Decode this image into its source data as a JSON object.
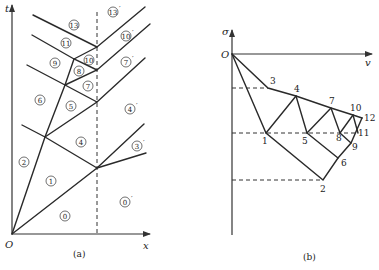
{
  "panel_a": {
    "caption": "(a)",
    "y_axis_label": "t",
    "x_axis_label": "x",
    "origin_label": "O",
    "regions": [
      {
        "id": "r13",
        "label": "13",
        "prime": false,
        "x": 74,
        "y": 25
      },
      {
        "id": "r13p",
        "label": "13",
        "prime": true,
        "x": 113,
        "y": 12
      },
      {
        "id": "r11",
        "label": "11",
        "prime": false,
        "x": 66,
        "y": 43
      },
      {
        "id": "r10p",
        "label": "10",
        "prime": true,
        "x": 126,
        "y": 36
      },
      {
        "id": "r9",
        "label": "9",
        "prime": false,
        "x": 55,
        "y": 63
      },
      {
        "id": "r10",
        "label": "10",
        "prime": false,
        "x": 89,
        "y": 60
      },
      {
        "id": "r8",
        "label": "8",
        "prime": false,
        "x": 79,
        "y": 71
      },
      {
        "id": "r7p",
        "label": "7",
        "prime": true,
        "x": 126,
        "y": 62
      },
      {
        "id": "r7",
        "label": "7",
        "prime": false,
        "x": 88,
        "y": 86
      },
      {
        "id": "r6",
        "label": "6",
        "prime": false,
        "x": 40,
        "y": 100
      },
      {
        "id": "r5",
        "label": "5",
        "prime": false,
        "x": 71,
        "y": 106
      },
      {
        "id": "r4p",
        "label": "4",
        "prime": true,
        "x": 130,
        "y": 109
      },
      {
        "id": "r4",
        "label": "4",
        "prime": false,
        "x": 81,
        "y": 142
      },
      {
        "id": "r3p",
        "label": "3",
        "prime": true,
        "x": 137,
        "y": 146
      },
      {
        "id": "r2",
        "label": "2",
        "prime": false,
        "x": 24,
        "y": 162
      },
      {
        "id": "r1",
        "label": "1",
        "prime": false,
        "x": 51,
        "y": 181
      },
      {
        "id": "r0p",
        "label": "0",
        "prime": true,
        "x": 125,
        "y": 202
      },
      {
        "id": "r0",
        "label": "0",
        "prime": false,
        "x": 65,
        "y": 216
      }
    ]
  },
  "panel_b": {
    "caption": "(b)",
    "y_axis_label": "σ",
    "x_axis_label": "v",
    "origin_label": "O",
    "points": [
      {
        "label": "1",
        "x": 266,
        "y": 133,
        "lx": 262,
        "ly": 144
      },
      {
        "label": "2",
        "x": 323,
        "y": 180,
        "lx": 320,
        "ly": 192
      },
      {
        "label": "3",
        "x": 268,
        "y": 88,
        "lx": 270,
        "ly": 84
      },
      {
        "label": "4",
        "x": 296,
        "y": 96,
        "lx": 294,
        "ly": 92
      },
      {
        "label": "5",
        "x": 307,
        "y": 133,
        "lx": 302,
        "ly": 144
      },
      {
        "label": "6",
        "x": 338,
        "y": 158,
        "lx": 341,
        "ly": 166
      },
      {
        "label": "7",
        "x": 331,
        "y": 108,
        "lx": 329,
        "ly": 104
      },
      {
        "label": "8",
        "x": 340,
        "y": 133,
        "lx": 336,
        "ly": 141
      },
      {
        "label": "9",
        "x": 351,
        "y": 143,
        "lx": 352,
        "ly": 150
      },
      {
        "label": "10",
        "x": 353,
        "y": 115,
        "lx": 350,
        "ly": 111
      },
      {
        "label": "11",
        "x": 358,
        "y": 133,
        "lx": 358,
        "ly": 136
      },
      {
        "label": "12",
        "x": 362,
        "y": 118,
        "lx": 364,
        "ly": 121
      }
    ]
  }
}
